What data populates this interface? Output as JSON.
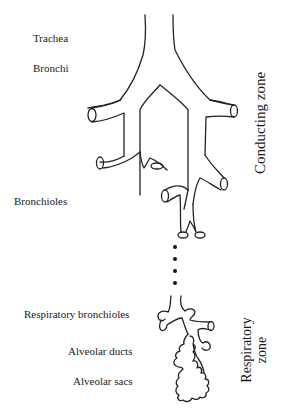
{
  "diagram": {
    "labels": {
      "trachea": "Trachea",
      "bronchi": "Bronchi",
      "bronchioles": "Bronchioles",
      "respiratory_bronchioles": "Respiratory bronchioles",
      "alveolar_ducts": "Alveolar ducts",
      "alveolar_sacs": "Alveolar sacs"
    },
    "zones": {
      "conducting": "Conducting zone",
      "respiratory_line1": "Respiratory",
      "respiratory_line2": "zone"
    },
    "continuation_dots": 4,
    "line_color": "#222222"
  }
}
